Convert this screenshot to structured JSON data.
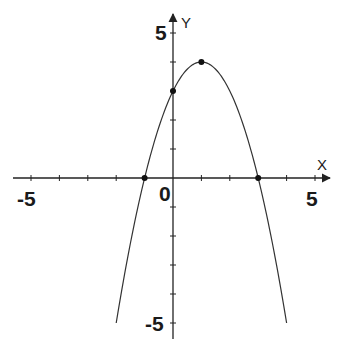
{
  "chart_data": {
    "type": "line",
    "title": "",
    "xlabel": "X",
    "ylabel": "Y",
    "xlim": [
      -5,
      5
    ],
    "ylim": [
      -5,
      5
    ],
    "grid": false,
    "function": "y = -x^2 + 2x + 3",
    "series": [
      {
        "name": "parabola",
        "x": [
          -2,
          -1.5,
          -1,
          -0.5,
          0,
          0.5,
          1,
          1.5,
          2,
          2.5,
          3,
          3.5,
          4
        ],
        "values": [
          -5,
          -2.25,
          0,
          1.75,
          3,
          3.75,
          4,
          3.75,
          3,
          1.75,
          0,
          -2.25,
          -5
        ]
      }
    ],
    "marked_points": [
      {
        "label": "root-left",
        "x": -1,
        "y": 0
      },
      {
        "label": "y-intercept",
        "x": 0,
        "y": 3
      },
      {
        "label": "vertex",
        "x": 1,
        "y": 4
      },
      {
        "label": "root-right",
        "x": 3,
        "y": 0
      }
    ],
    "tick_labels": {
      "x": [
        "-5",
        "0",
        "5"
      ],
      "y": [
        "5",
        "-5"
      ]
    }
  },
  "labels": {
    "x_axis": "X",
    "y_axis": "Y",
    "x_neg5": "-5",
    "x_pos5": "5",
    "origin": "0",
    "y_pos5": "5",
    "y_neg5": "-5"
  },
  "style": {
    "axis_color": "#222222",
    "curve_color": "#333333",
    "point_color": "#111111"
  }
}
